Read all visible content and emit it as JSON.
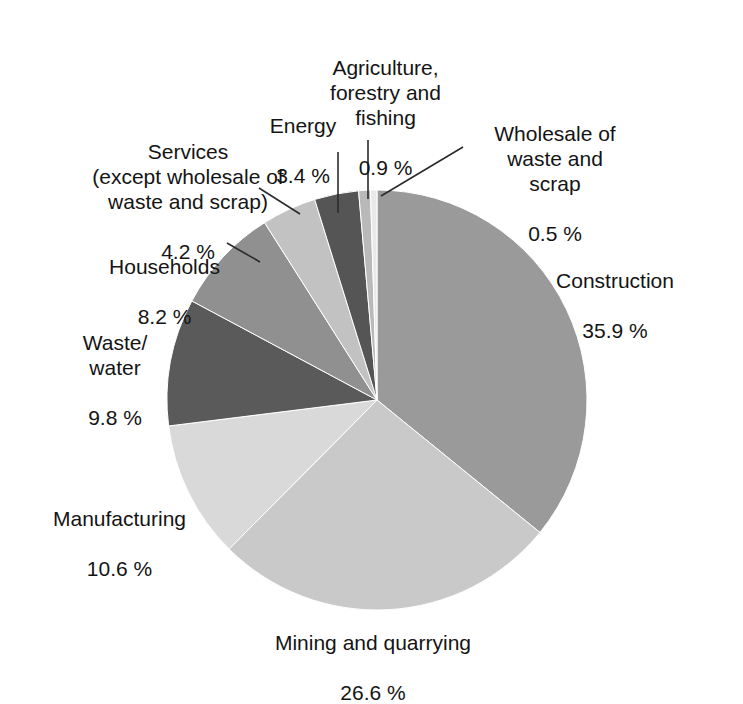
{
  "chart_data": {
    "type": "pie",
    "title": "",
    "subtitle": "",
    "xlabel": "",
    "ylabel": "",
    "legend_position": "none",
    "grid": false,
    "unit": "%",
    "start_angle_deg": 0,
    "direction": "clockwise",
    "center": {
      "x": 377,
      "y": 400
    },
    "radius": 210,
    "categories": [
      "Construction",
      "Mining and quarrying",
      "Manufacturing",
      "Waste/ water",
      "Households",
      "Services (except wholesale of waste and scrap)",
      "Energy",
      "Agriculture, forestry and fishing",
      "Wholesale of waste and scrap"
    ],
    "values": [
      35.9,
      26.6,
      10.6,
      9.8,
      8.2,
      4.2,
      3.4,
      0.9,
      0.5
    ],
    "colors": [
      "#9a9a9a",
      "#c9c9c9",
      "#d9d9d9",
      "#5a5a5a",
      "#909090",
      "#c2c2c2",
      "#555555",
      "#b9b9b9",
      "#e9e9e9"
    ],
    "slices": [
      {
        "name": "Construction",
        "value": 35.9,
        "color": "#9a9a9a"
      },
      {
        "name": "Mining and quarrying",
        "value": 26.6,
        "color": "#c9c9c9"
      },
      {
        "name": "Manufacturing",
        "value": 10.6,
        "color": "#d9d9d9"
      },
      {
        "name": "Waste/ water",
        "value": 9.8,
        "color": "#5a5a5a"
      },
      {
        "name": "Households",
        "value": 8.2,
        "color": "#909090"
      },
      {
        "name": "Services (except wholesale of waste and scrap)",
        "value": 4.2,
        "color": "#c2c2c2"
      },
      {
        "name": "Energy",
        "value": 3.4,
        "color": "#555555"
      },
      {
        "name": "Agriculture, forestry and fishing",
        "value": 0.9,
        "color": "#b9b9b9"
      },
      {
        "name": "Wholesale of waste and scrap",
        "value": 0.5,
        "color": "#e9e9e9"
      }
    ]
  },
  "labels": {
    "construction": {
      "name": "Construction",
      "pct": "35.9 %"
    },
    "mining": {
      "name": "Mining and quarrying",
      "pct": "26.6 %"
    },
    "manufacturing": {
      "name": "Manufacturing",
      "pct": "10.6 %"
    },
    "waste_water": {
      "name": "Waste/\nwater",
      "pct": "9.8 %"
    },
    "households": {
      "name": "Households",
      "pct": "8.2 %"
    },
    "services": {
      "name": "Services\n(except wholesale of\nwaste and scrap)",
      "pct": "4.2 %"
    },
    "energy": {
      "name": "Energy",
      "pct": "3.4 %"
    },
    "agriculture": {
      "name": "Agriculture,\nforestry and\nfishing",
      "pct": "0.9 %"
    },
    "wholesale": {
      "name": "Wholesale of\nwaste and\nscrap",
      "pct": "0.5 %"
    }
  },
  "style": {
    "background": "#ffffff",
    "text_color": "#141414",
    "leader_line_color": "#2b2b2b"
  }
}
